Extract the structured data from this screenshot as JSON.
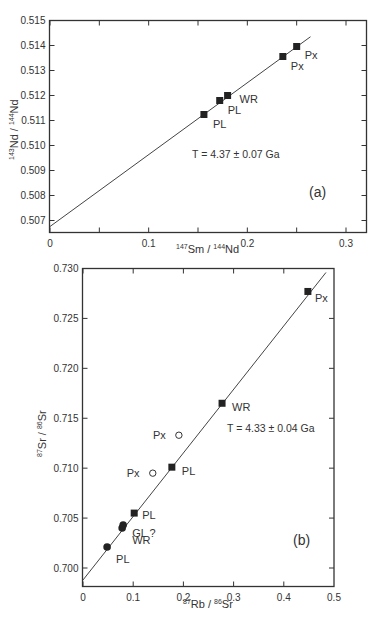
{
  "chart_data": [
    {
      "type": "scatter",
      "panel_label": "(a)",
      "title": "",
      "xlabel": "147Sm / 144Nd",
      "xlabel_parts": {
        "sup1": "147",
        "t1": "Sm / ",
        "sup2": "144",
        "t2": "Nd"
      },
      "ylabel": "143Nd / 144Nd",
      "ylabel_parts": {
        "sup1": "143",
        "t1": "Nd / ",
        "sup2": "144",
        "t2": "Nd"
      },
      "xlim": [
        0,
        0.32
      ],
      "ylim": [
        0.5066,
        0.515
      ],
      "xticks": [
        0,
        0.1,
        0.2,
        0.3
      ],
      "xtick_labels": [
        "0",
        "0.1",
        "0.2",
        "0.3"
      ],
      "yticks": [
        0.507,
        0.508,
        0.509,
        0.51,
        0.511,
        0.512,
        0.513,
        0.514,
        0.515
      ],
      "ytick_labels": [
        "0.507",
        "0.508",
        "0.509",
        "0.510",
        "0.511",
        "0.512",
        "0.513",
        "0.514",
        "0.515"
      ],
      "grid": false,
      "annotation": "T = 4.37 ± 0.07 Ga",
      "isochron": {
        "x0": 0,
        "y0": 0.50676,
        "x1": 0.264,
        "y1": 0.51435
      },
      "points": [
        {
          "label": "PL",
          "x": 0.156,
          "y": 0.51124,
          "marker": "filled-square"
        },
        {
          "label": "PL",
          "x": 0.172,
          "y": 0.5118,
          "marker": "filled-square"
        },
        {
          "label": "WR",
          "x": 0.18,
          "y": 0.512,
          "marker": "filled-square"
        },
        {
          "label": "Px",
          "x": 0.236,
          "y": 0.51356,
          "marker": "filled-square"
        },
        {
          "label": "Px",
          "x": 0.25,
          "y": 0.51396,
          "marker": "filled-square"
        }
      ]
    },
    {
      "type": "scatter",
      "panel_label": "(b)",
      "title": "",
      "xlabel": "87Rb / 86Sr",
      "xlabel_parts": {
        "sup1": "87",
        "t1": "Rb / ",
        "sup2": "86",
        "t2": "Sr"
      },
      "ylabel": "87Sr / 86Sr",
      "ylabel_parts": {
        "sup1": "87",
        "t1": "Sr / ",
        "sup2": "86",
        "t2": "Sr"
      },
      "xlim": [
        0,
        0.5
      ],
      "ylim": [
        0.6982,
        0.73
      ],
      "xticks": [
        0,
        0.1,
        0.2,
        0.3,
        0.4,
        0.5
      ],
      "xtick_labels": [
        "0",
        "0.1",
        "0.2",
        "0.3",
        "0.4",
        "0.5"
      ],
      "yticks": [
        0.7,
        0.705,
        0.71,
        0.715,
        0.72,
        0.725,
        0.73
      ],
      "ytick_labels": [
        "0.700",
        "0.705",
        "0.710",
        "0.715",
        "0.720",
        "0.725",
        "0.730"
      ],
      "grid": false,
      "annotation": "T = 4.33 ± 0.04 Ga",
      "isochron": {
        "x0": 0,
        "y0": 0.6988,
        "x1": 0.484,
        "y1": 0.7296
      },
      "points": [
        {
          "label": "PL",
          "x": 0.048,
          "y": 0.7021,
          "marker": "filled-circle"
        },
        {
          "label": "WR",
          "x": 0.078,
          "y": 0.704,
          "marker": "filled-circle"
        },
        {
          "label": "GL ?",
          "x": 0.08,
          "y": 0.7043,
          "marker": "filled-circle"
        },
        {
          "label": "PL",
          "x": 0.102,
          "y": 0.7055,
          "marker": "filled-square"
        },
        {
          "label": "Px",
          "x": 0.139,
          "y": 0.7095,
          "marker": "open-circle"
        },
        {
          "label": "PL",
          "x": 0.177,
          "y": 0.7101,
          "marker": "filled-square"
        },
        {
          "label": "Px",
          "x": 0.191,
          "y": 0.7133,
          "marker": "open-circle"
        },
        {
          "label": "WR",
          "x": 0.277,
          "y": 0.7165,
          "marker": "filled-square"
        },
        {
          "label": "Px",
          "x": 0.448,
          "y": 0.7277,
          "marker": "filled-square"
        }
      ]
    }
  ]
}
